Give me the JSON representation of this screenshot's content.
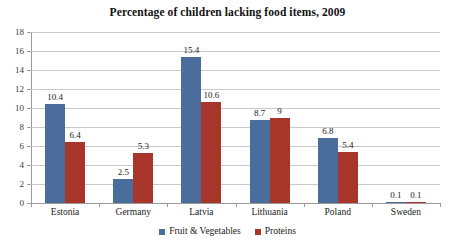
{
  "chart_data": {
    "type": "bar",
    "title": "Percentage of children lacking food items, 2009",
    "xlabel": "",
    "ylabel": "",
    "ylim": [
      0,
      18
    ],
    "ytick_step": 2,
    "yticks": [
      "18",
      "16",
      "14",
      "12",
      "10",
      "8",
      "6",
      "4",
      "2",
      "0"
    ],
    "grid": true,
    "legend_position": "bottom",
    "categories": [
      "Estonia",
      "Germany",
      "Latvia",
      "Lithuania",
      "Poland",
      "Sweden"
    ],
    "series": [
      {
        "name": "Fruit & Vegetables",
        "color": "#4a6d9c",
        "values": [
          10.4,
          2.5,
          15.4,
          8.7,
          6.8,
          0.1
        ],
        "labels": [
          "10.4",
          "2.5",
          "15.4",
          "8.7",
          "6.8",
          "0.1"
        ]
      },
      {
        "name": "Proteins",
        "color": "#a8352a",
        "values": [
          6.4,
          5.3,
          10.6,
          9,
          5.4,
          0.1
        ],
        "labels": [
          "6.4",
          "5.3",
          "10.6",
          "9",
          "5.4",
          "0.1"
        ]
      }
    ]
  },
  "colors": {
    "fruit_vegetables": "#4a6d9c",
    "proteins": "#a8352a",
    "gridline": "#c8c8c8",
    "axis": "#9a9a9a",
    "background": "#ffffff",
    "text": "#1a1a1a"
  }
}
